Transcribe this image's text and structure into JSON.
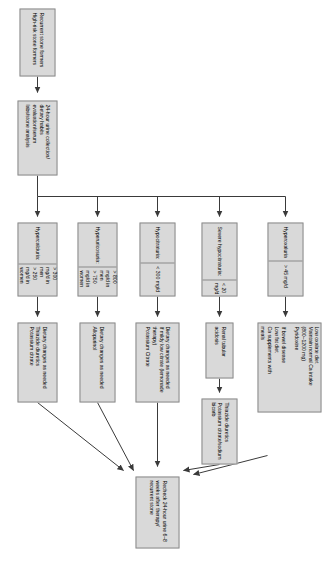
{
  "figure": {
    "type": "clinical-flowchart",
    "orientation": "rotated-90"
  },
  "entry": {
    "population": {
      "line1": "Recurrent stone formers",
      "line2": "High-risk stone formers"
    },
    "workup": {
      "line1": "24-hour urine collection/",
      "line2": "dietary habits evaluation/serum",
      "line3": "labs/stone analysis"
    }
  },
  "branches": [
    {
      "id": "hypercalciuria",
      "diagnosis": {
        "label": "Hypercalciuria:",
        "values": [
          "> 300 mg/d in men",
          ">  250 mg/d in women"
        ]
      },
      "treatment": {
        "lines": [
          "Dietary changes as needed",
          "Thiazide diuretics",
          "Potassium citrate"
        ]
      }
    },
    {
      "id": "hyperuricosuria",
      "diagnosis": {
        "label": "Hyperuricosuria:",
        "values": [
          "> 800 mg/d in men",
          ">  750 mg/d in women"
        ]
      },
      "treatment": {
        "lines": [
          "Dietary changes as needed",
          "Allopurinol"
        ]
      }
    },
    {
      "id": "hypocitraturia",
      "diagnosis": {
        "label": "Hypocitraturia:",
        "values": [
          "< 300 mg/d"
        ]
      },
      "treatment": {
        "lines": [
          "Dietary changes as needed",
          "If mildy low citrate (lemonade",
          "therapy)",
          "Potassium Citrate"
        ]
      }
    },
    {
      "id": "severe-hypocitraturia",
      "diagnosis": {
        "label": "Severe hypocitraturia:",
        "values": [
          "< 20 mg/d"
        ]
      },
      "treatment_cause": {
        "lines": [
          "Renal tubular acidosis"
        ]
      },
      "treatment": {
        "lines": [
          "Thiazide diuretics",
          "Potassium citrate/sodium",
          "bicarb"
        ]
      }
    },
    {
      "id": "hyperoxaluria",
      "diagnosis": {
        "label": "Hyperoxaluria",
        "values": [
          "> 45 mg/d"
        ]
      },
      "treatment": {
        "lines": [
          "Low oxalate diet",
          "Maintain normal Ca intake",
          "(800–1200 mg)",
          "Pyridoxine",
          "",
          "If bowel disease",
          "Low fat diet",
          "Ca supplements with",
          "meals"
        ]
      }
    }
  ],
  "outcome": {
    "lines": [
      "Recheck 24-hour urine 6–8",
      "weeks after therapy/",
      "recurrent stone"
    ]
  },
  "colors": {
    "node_fill": "#d9d9d9",
    "node_border": "#8a8a8a",
    "connector": "#3a3a3a",
    "text": "#000000"
  }
}
